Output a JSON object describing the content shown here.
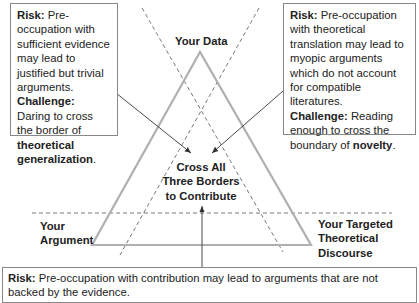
{
  "diagram": {
    "apex_label": "Your Data",
    "left_label_line1": "Your",
    "left_label_line2": "Argument",
    "right_label_line1": "Your Targeted",
    "right_label_line2": "Theoretical",
    "right_label_line3": "Discourse",
    "center_line1": "Cross All",
    "center_line2": "Three Borders",
    "center_line3": "to Contribute"
  },
  "left_box": {
    "risk_label": "Risk:",
    "risk_text": " Pre-occupation with sufficient evidence may lead to justified but trivial arguments.",
    "challenge_label": "Challenge:",
    "challenge_text": " Daring to cross the border of ",
    "challenge_bold": "theoretical generalization",
    "challenge_end": "."
  },
  "right_box": {
    "risk_label": "Risk:",
    "risk_text": " Pre-occupation with theoretical translation may lead to myopic arguments which do not account for compatible literatures.",
    "challenge_label": "Challenge:",
    "challenge_text": " Reading enough to cross the boundary of ",
    "challenge_bold": "novelty",
    "challenge_end": "."
  },
  "bottom_box": {
    "risk_label": "Risk:",
    "risk_text": " Pre-occupation with contribution may lead to arguments that are not backed by the evidence."
  },
  "colors": {
    "triangle": "#b0b0b0",
    "dashed": "#555555",
    "arrow": "#333333",
    "box_border": "#888888"
  }
}
